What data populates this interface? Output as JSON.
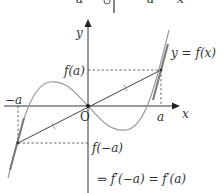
{
  "diagram": {
    "top_strip": {
      "labels": [
        "a",
        "O",
        "a",
        "x"
      ]
    },
    "axes": {
      "x_label": "x",
      "y_label": "y",
      "origin_label": "O"
    },
    "curve_label": "y = f(x)",
    "points": {
      "a_label": "a",
      "neg_a_label": "−a",
      "f_a_label": "f(a)",
      "f_neg_a_label": "f(−a)"
    },
    "conclusion": "⇒ f′(−a) = f′(a)",
    "colors": {
      "axis": "#333333",
      "curve": "#999999",
      "tangent": "#777777",
      "chord": "#444444"
    }
  }
}
